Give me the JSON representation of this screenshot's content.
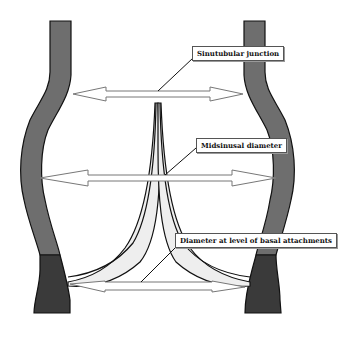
{
  "diagram": {
    "labels": {
      "sinotubular": "Sinutubular junction",
      "midsinusal": "Midsinusal diameter",
      "basal": "Diameter at level of basal attachments"
    },
    "colors": {
      "wall_upper": "#6e6e6e",
      "wall_lower": "#3a3a3a",
      "leaflet": "#eeeeee",
      "outline": "#111111",
      "arrow_fill": "#ffffff",
      "arrow_stroke": "#777777"
    }
  }
}
